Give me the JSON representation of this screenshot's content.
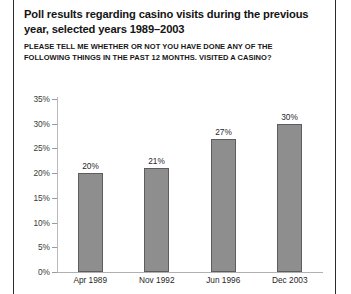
{
  "title": "Poll results regarding casino visits during the previous year, selected years 1989–2003",
  "subtitle": "PLEASE TELL ME WHETHER OR NOT YOU HAVE DONE ANY OF THE FOLLOWING THINGS IN THE PAST 12 MONTHS. VISITED A CASINO?",
  "colors": {
    "bar_fill": "#8e8e8e",
    "bar_edge": "#5d5d5d",
    "axis": "#b0b0b0",
    "frame_rule": "#2b2b2b",
    "text": "#1f1f1f",
    "background": "#ffffff"
  },
  "chart_data": {
    "type": "bar",
    "title": "Poll results regarding casino visits during the previous year, selected years 1989–2003",
    "subtitle": "PLEASE TELL ME WHETHER OR NOT YOU HAVE DONE ANY OF THE FOLLOWING THINGS IN THE PAST 12 MONTHS. VISITED A CASINO?",
    "xlabel": "",
    "ylabel": "",
    "categories": [
      "Apr 1989",
      "Nov 1992",
      "Jun 1996",
      "Dec 2003"
    ],
    "values": [
      20,
      21,
      27,
      30
    ],
    "value_labels": [
      "20%",
      "21%",
      "27%",
      "30%"
    ],
    "ylim": [
      0,
      35
    ],
    "ytick_values": [
      0,
      5,
      10,
      15,
      20,
      25,
      30,
      35
    ],
    "ytick_labels": [
      "0%",
      "5%",
      "10%",
      "15%",
      "20%",
      "25%",
      "30%",
      "35%"
    ],
    "grid": false,
    "legend": false,
    "units": "percent"
  }
}
